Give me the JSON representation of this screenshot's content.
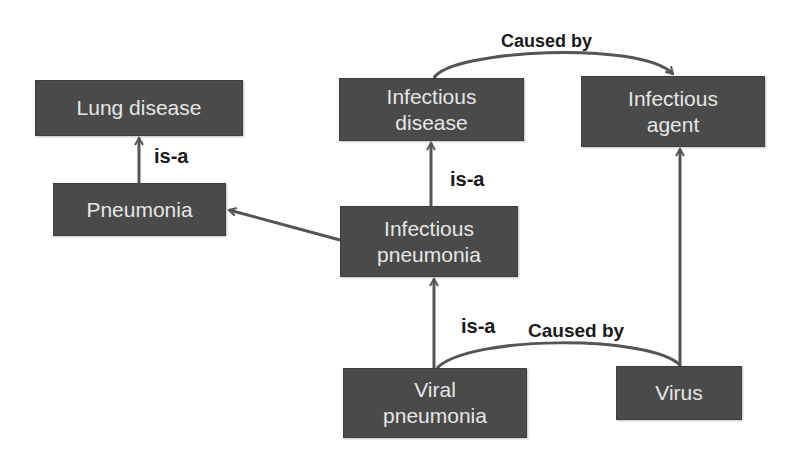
{
  "diagram": {
    "type": "ontology-graph",
    "nodes": [
      {
        "id": "lung_disease",
        "label": "Lung disease"
      },
      {
        "id": "pneumonia",
        "label": "Pneumonia"
      },
      {
        "id": "infectious_disease",
        "label": "Infectious\ndisease"
      },
      {
        "id": "infectious_agent",
        "label": "Infectious\nagent"
      },
      {
        "id": "infectious_pneumonia",
        "label": "Infectious\npneumonia"
      },
      {
        "id": "viral_pneumonia",
        "label": "Viral\npneumonia"
      },
      {
        "id": "virus",
        "label": "Virus"
      }
    ],
    "edges": [
      {
        "from": "pneumonia",
        "to": "lung_disease",
        "label": "is-a"
      },
      {
        "from": "infectious_pneumonia",
        "to": "infectious_disease",
        "label": "is-a"
      },
      {
        "from": "infectious_pneumonia",
        "to": "pneumonia",
        "label": ""
      },
      {
        "from": "viral_pneumonia",
        "to": "infectious_pneumonia",
        "label": "is-a"
      },
      {
        "from": "infectious_disease",
        "to": "infectious_agent",
        "label": "Caused by"
      },
      {
        "from": "viral_pneumonia",
        "to": "virus",
        "label": "Caused by"
      },
      {
        "from": "virus",
        "to": "infectious_agent",
        "label": ""
      }
    ],
    "edge_labels": {
      "isa_lung": "is-a",
      "isa_infectious": "is-a",
      "isa_viral": "is-a",
      "caused_top": "Caused by",
      "caused_bottom": "Caused by"
    },
    "colors": {
      "node_fill": "#4a4a4a",
      "node_text": "#e6e6e6",
      "edge": "#555555",
      "label_text": "#1a1a1a"
    }
  }
}
